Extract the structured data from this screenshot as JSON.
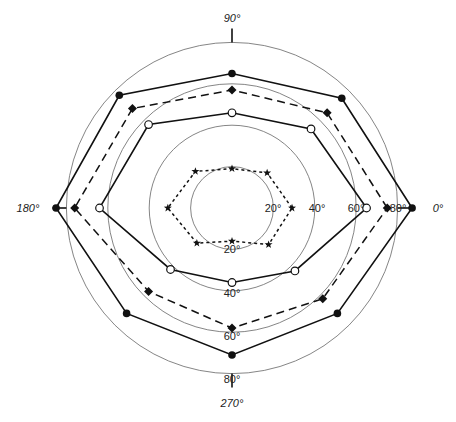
{
  "chart_data": {
    "type": "polar",
    "title": "",
    "center_px": [
      232,
      208
    ],
    "px_per_unit": 2.07,
    "angle_labels": [
      {
        "angle": 0,
        "label": "0°"
      },
      {
        "angle": 90,
        "label": "90°"
      },
      {
        "angle": 180,
        "label": "180°"
      },
      {
        "angle": 270,
        "label": "270°"
      }
    ],
    "rings": [
      20,
      40,
      60,
      80
    ],
    "ring_labels_right": [
      "20°",
      "40°",
      "60°",
      "80°"
    ],
    "ring_labels_bottom": [
      "20°",
      "40°",
      "60°",
      "80°"
    ],
    "theta": [
      0,
      45,
      90,
      135,
      180,
      225,
      270,
      315
    ],
    "series": [
      {
        "name": "filled-circle",
        "marker": "circle-filled",
        "line": "solid",
        "values": [
          87,
          75,
          65,
          77,
          85,
          72,
          71,
          72
        ]
      },
      {
        "name": "diamond",
        "marker": "diamond",
        "line": "dashed",
        "values": [
          75,
          65,
          57,
          68,
          76,
          57,
          58,
          62
        ]
      },
      {
        "name": "open-circle",
        "marker": "circle-open",
        "line": "solid",
        "values": [
          65,
          54,
          46,
          57,
          64,
          42,
          36,
          43
        ]
      },
      {
        "name": "star",
        "marker": "star",
        "line": "dotted",
        "values": [
          29,
          24,
          19,
          25,
          31,
          24,
          16,
          25
        ]
      }
    ],
    "legend": []
  }
}
